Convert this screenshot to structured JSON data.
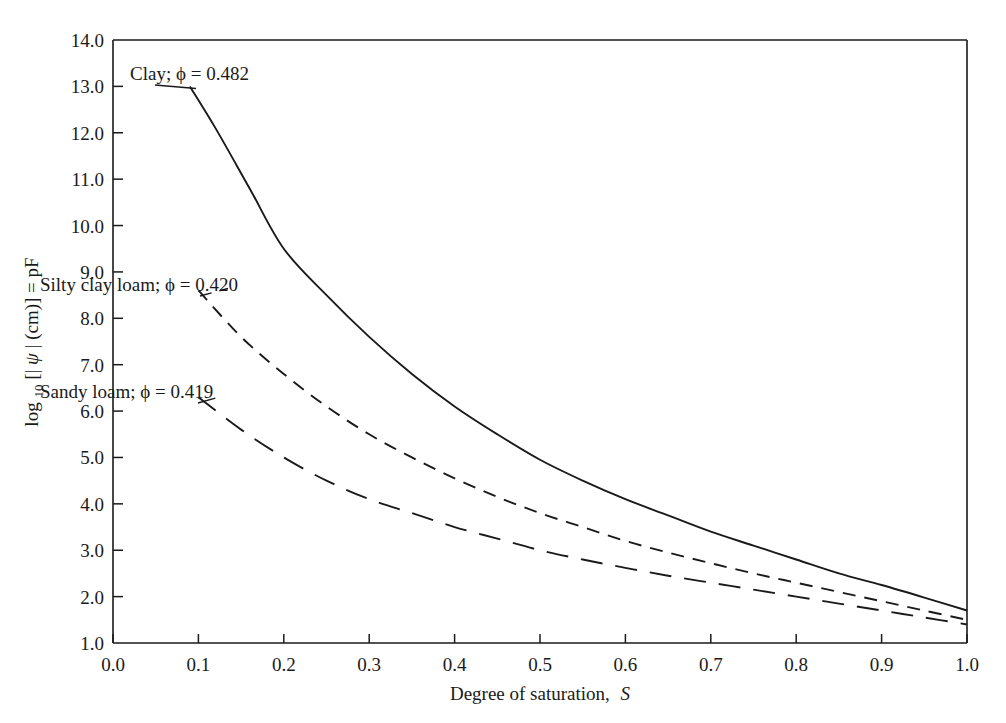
{
  "chart_data": {
    "type": "line",
    "title": "",
    "xlabel": "Degree of saturation, S",
    "ylabel": "log10[|psi| (cm)] = pF",
    "xlim": [
      0.0,
      1.0
    ],
    "ylim": [
      1.0,
      14.0
    ],
    "xticks": [
      "0.0",
      "0.1",
      "0.2",
      "0.3",
      "0.4",
      "0.5",
      "0.6",
      "0.7",
      "0.8",
      "0.9",
      "1.0"
    ],
    "yticks": [
      "1.0",
      "2.0",
      "3.0",
      "4.0",
      "5.0",
      "6.0",
      "7.0",
      "8.0",
      "9.0",
      "10.0",
      "11.0",
      "12.0",
      "13.0",
      "14.0"
    ],
    "grid": false,
    "legend_position": "inline-annotations",
    "series": [
      {
        "name": "Clay",
        "annotation": "Clay; ϕ = 0.482",
        "porosity": 0.482,
        "style": "solid",
        "x": [
          0.09,
          0.12,
          0.16,
          0.2,
          0.25,
          0.3,
          0.35,
          0.4,
          0.45,
          0.5,
          0.55,
          0.6,
          0.65,
          0.7,
          0.75,
          0.8,
          0.85,
          0.9,
          0.95,
          1.0
        ],
        "y": [
          13.0,
          12.1,
          10.8,
          9.5,
          8.5,
          7.6,
          6.8,
          6.1,
          5.5,
          4.95,
          4.5,
          4.1,
          3.75,
          3.4,
          3.1,
          2.8,
          2.5,
          2.25,
          1.98,
          1.7
        ]
      },
      {
        "name": "Silty clay loam",
        "annotation": "Silty clay loam; ϕ = 0.420",
        "porosity": 0.42,
        "style": "dashed",
        "x": [
          0.1,
          0.15,
          0.2,
          0.25,
          0.3,
          0.35,
          0.4,
          0.45,
          0.5,
          0.55,
          0.6,
          0.65,
          0.7,
          0.75,
          0.8,
          0.85,
          0.9,
          0.95,
          1.0
        ],
        "y": [
          8.6,
          7.6,
          6.8,
          6.1,
          5.5,
          5.0,
          4.55,
          4.15,
          3.8,
          3.5,
          3.2,
          2.95,
          2.72,
          2.5,
          2.3,
          2.1,
          1.9,
          1.7,
          1.5
        ]
      },
      {
        "name": "Sandy loam",
        "annotation": "Sandy loam; ϕ = 0.419",
        "porosity": 0.419,
        "style": "longdash",
        "x": [
          0.1,
          0.15,
          0.2,
          0.25,
          0.3,
          0.35,
          0.4,
          0.45,
          0.5,
          0.55,
          0.6,
          0.65,
          0.7,
          0.75,
          0.8,
          0.85,
          0.9,
          0.95,
          1.0
        ],
        "y": [
          6.3,
          5.6,
          5.0,
          4.5,
          4.1,
          3.8,
          3.5,
          3.25,
          3.0,
          2.8,
          2.62,
          2.45,
          2.3,
          2.15,
          2.0,
          1.85,
          1.7,
          1.55,
          1.4
        ]
      }
    ],
    "colors": {
      "axis": "#1a1a1a",
      "curve": "#1a1a1a",
      "background": "#ffffff"
    }
  },
  "axis": {
    "x_title_main": "Degree of saturation,",
    "x_title_symbol": "S",
    "y_title_log": "log",
    "y_title_sub": "10",
    "y_title_rest_open": "[|",
    "y_title_psi": "ψ",
    "y_title_rest_close": "| (cm)] = pF"
  },
  "annotations": [
    {
      "text": "Clay; ϕ = 0.482",
      "name": "clay-label"
    },
    {
      "text": "Silty clay loam; ϕ = 0.420",
      "name": "silty-clay-loam-label"
    },
    {
      "text": "Sandy loam; ϕ = 0.419",
      "name": "sandy-loam-label"
    }
  ]
}
